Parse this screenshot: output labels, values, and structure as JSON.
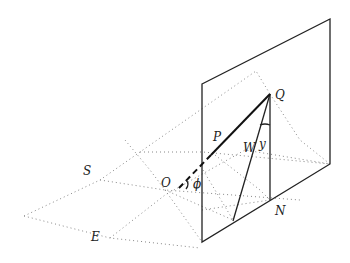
{
  "diagram": {
    "labels": {
      "Q": "Q",
      "P": "P",
      "W": "W",
      "y": "y",
      "O": "O",
      "phi": "ϕ",
      "S": "S",
      "E": "E",
      "N": "N"
    }
  }
}
